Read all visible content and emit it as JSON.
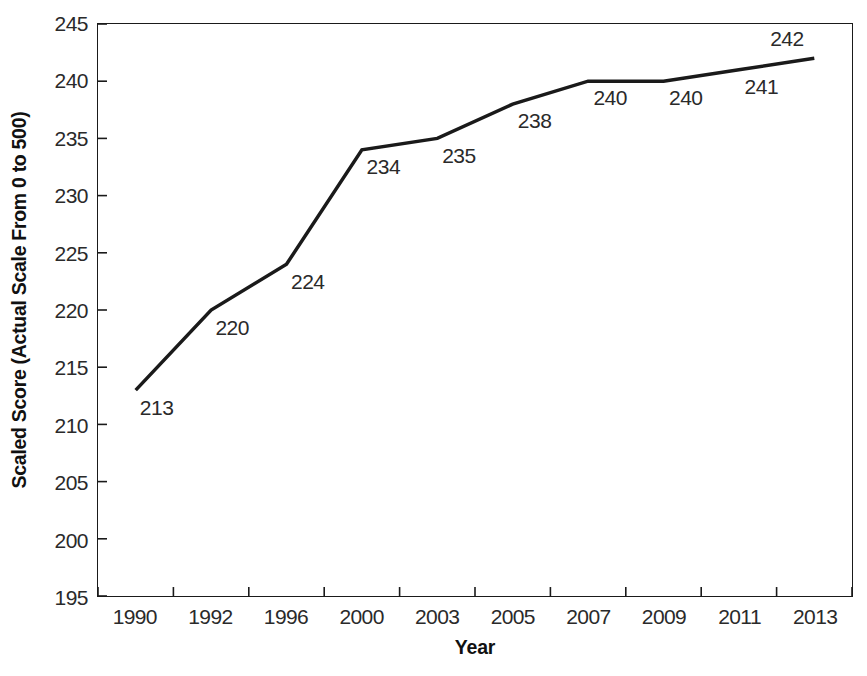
{
  "chart_data": {
    "type": "line",
    "title": "",
    "xlabel": "Year",
    "ylabel": "Scaled Score (Actual Scale From 0 to 500)",
    "categories": [
      "1990",
      "1992",
      "1996",
      "2000",
      "2003",
      "2005",
      "2007",
      "2009",
      "2011",
      "2013"
    ],
    "values": [
      213,
      220,
      224,
      234,
      235,
      238,
      240,
      240,
      241,
      242
    ],
    "point_labels": [
      "213",
      "220",
      "224",
      "234",
      "235",
      "238",
      "240",
      "240",
      "241",
      "242"
    ],
    "label_positions": [
      "below-right",
      "below-right",
      "below-right",
      "below-right",
      "below-right",
      "below-right",
      "below-right",
      "below-right",
      "below-right",
      "above-left"
    ],
    "ylim": [
      195,
      245
    ],
    "yticks": [
      195,
      200,
      205,
      210,
      215,
      220,
      225,
      230,
      235,
      240,
      245
    ],
    "ytick_labels": [
      "195",
      "200",
      "205",
      "210",
      "215",
      "220",
      "225",
      "230",
      "235",
      "240",
      "245"
    ],
    "grid": false,
    "legend": false,
    "line_color": "#1a1a1a",
    "line_width": 3.5,
    "axis_color": "#1a1a1a",
    "background_color": "#ffffff"
  }
}
